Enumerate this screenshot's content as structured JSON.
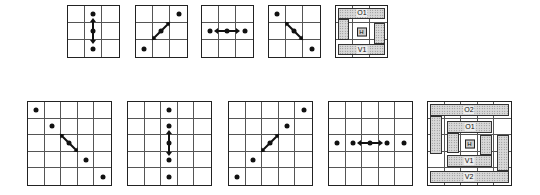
{
  "figure": {
    "rows": [
      {
        "name": "3x3-row",
        "size": 3,
        "panels": [
          {
            "id": "top-vertical",
            "orientation": "vertical",
            "dots": [
              [
                0,
                1
              ],
              [
                1,
                1
              ],
              [
                2,
                1
              ]
            ],
            "arrow_cell": [
              1,
              1
            ],
            "arrow_angle": 90
          },
          {
            "id": "top-diagonal-ne",
            "orientation": "diagonal-ne",
            "dots": [
              [
                0,
                2
              ],
              [
                1,
                1
              ],
              [
                2,
                0
              ]
            ],
            "arrow_cell": [
              1,
              1
            ],
            "arrow_angle": -45
          },
          {
            "id": "top-horizontal",
            "orientation": "horizontal",
            "dots": [
              [
                1,
                0
              ],
              [
                1,
                1
              ],
              [
                1,
                2
              ]
            ],
            "arrow_cell": [
              1,
              1
            ],
            "arrow_angle": 0
          },
          {
            "id": "top-diagonal-nw",
            "orientation": "diagonal-nw",
            "dots": [
              [
                0,
                0
              ],
              [
                1,
                1
              ],
              [
                2,
                2
              ]
            ],
            "arrow_cell": [
              1,
              1
            ],
            "arrow_angle": 45
          }
        ],
        "summary": {
          "labels": {
            "o1": "O1",
            "h": "H",
            "v1": "V1"
          }
        }
      },
      {
        "name": "5x5-row",
        "size": 5,
        "panels": [
          {
            "id": "bottom-diagonal-nw",
            "orientation": "diagonal-nw",
            "dots": [
              [
                0,
                0
              ],
              [
                1,
                1
              ],
              [
                2,
                2
              ],
              [
                3,
                3
              ],
              [
                4,
                4
              ]
            ],
            "arrow_cell": [
              2,
              2
            ],
            "arrow_angle": 45
          },
          {
            "id": "bottom-vertical",
            "orientation": "vertical",
            "dots": [
              [
                0,
                2
              ],
              [
                1,
                2
              ],
              [
                2,
                2
              ],
              [
                3,
                2
              ],
              [
                4,
                2
              ]
            ],
            "arrow_cell": [
              2,
              2
            ],
            "arrow_angle": 90
          },
          {
            "id": "bottom-diagonal-ne",
            "orientation": "diagonal-ne",
            "dots": [
              [
                0,
                4
              ],
              [
                1,
                3
              ],
              [
                2,
                2
              ],
              [
                3,
                1
              ],
              [
                4,
                0
              ]
            ],
            "arrow_cell": [
              2,
              2
            ],
            "arrow_angle": -45
          },
          {
            "id": "bottom-horizontal",
            "orientation": "horizontal",
            "dots": [
              [
                2,
                0
              ],
              [
                2,
                1
              ],
              [
                2,
                2
              ],
              [
                2,
                3
              ],
              [
                2,
                4
              ]
            ],
            "arrow_cell": [
              2,
              2
            ],
            "arrow_angle": 0
          }
        ],
        "summary": {
          "labels": {
            "o2": "O2",
            "o1": "O1",
            "h": "H",
            "v1": "V1",
            "v2": "V2"
          }
        }
      }
    ]
  }
}
